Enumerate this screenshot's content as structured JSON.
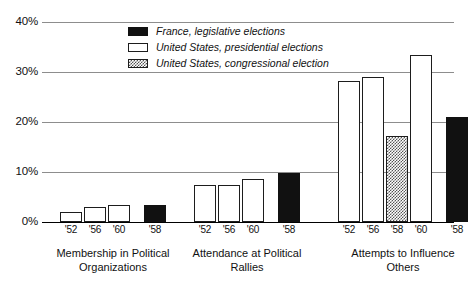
{
  "chart_data": {
    "type": "bar",
    "title": "",
    "xlabel": "",
    "ylabel": "",
    "ylim": [
      0,
      40
    ],
    "yticks": [
      0,
      10,
      20,
      30,
      40
    ],
    "ytick_labels": [
      "0%",
      "10%",
      "20%",
      "30%",
      "40%"
    ],
    "grid": true,
    "legend_position": "top-center",
    "legend": [
      {
        "key": "france",
        "label": "France, legislative elections",
        "fill": "solid-black"
      },
      {
        "key": "us_presidential",
        "label": "United States, presidential elections",
        "fill": "white"
      },
      {
        "key": "us_congressional",
        "label": "United States, congressional election",
        "fill": "dotted"
      }
    ],
    "groups": [
      {
        "label_lines": [
          "Membership in Political",
          "Organizations"
        ],
        "bars": [
          {
            "tick": "'52",
            "series": "us_presidential",
            "value": 2.0
          },
          {
            "tick": "'56",
            "series": "us_presidential",
            "value": 3.0
          },
          {
            "tick": "'60",
            "series": "us_presidential",
            "value": 3.5
          },
          {
            "tick": "'58",
            "series": "france",
            "value": 3.5
          }
        ]
      },
      {
        "label_lines": [
          "Attendance at Political",
          "Rallies"
        ],
        "bars": [
          {
            "tick": "'52",
            "series": "us_presidential",
            "value": 7.5
          },
          {
            "tick": "'56",
            "series": "us_presidential",
            "value": 7.5
          },
          {
            "tick": "'60",
            "series": "us_presidential",
            "value": 8.7
          },
          {
            "tick": "'58",
            "series": "france",
            "value": 9.8
          }
        ]
      },
      {
        "label_lines": [
          "Attempts to Influence",
          "Others"
        ],
        "bars": [
          {
            "tick": "'52",
            "series": "us_presidential",
            "value": 28.3
          },
          {
            "tick": "'56",
            "series": "us_presidential",
            "value": 29.0
          },
          {
            "tick": "'58",
            "series": "us_congressional",
            "value": 17.3
          },
          {
            "tick": "'60",
            "series": "us_presidential",
            "value": 33.5
          },
          {
            "tick": "'58",
            "series": "france",
            "value": 21.0
          }
        ]
      }
    ],
    "colors": {
      "france": "#111111",
      "us_presidential": "#ffffff",
      "us_congressional_pattern": "#555555",
      "axis": "#000000",
      "gridline": "#8d8d8d"
    }
  }
}
